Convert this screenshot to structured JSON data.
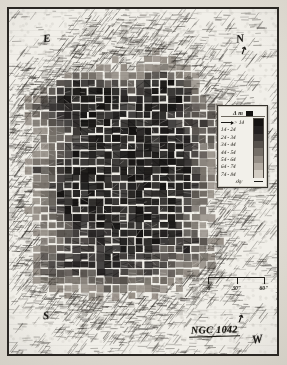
{
  "figure": {
    "object_name": "NGC 1042",
    "plot_type": "hand-drawn surface photometry / isophote cell map",
    "background_note": "scanned printed plate with dark rectangular frame"
  },
  "compass": {
    "east": "E",
    "north": "N",
    "south": "S",
    "west": "W",
    "north_tick": "↗",
    "west_tick": "↗"
  },
  "legend": {
    "header_symbol": "Δ m",
    "header_swatch_color": "#141211",
    "rows": [
      {
        "label": "> 14",
        "swatch": "#141211"
      },
      {
        "label": "14 - 24",
        "swatch": "#232020"
      },
      {
        "label": "24 - 34",
        "swatch": "#3a3634"
      },
      {
        "label": "34 - 44",
        "swatch": "#56514c"
      },
      {
        "label": "44 - 54",
        "swatch": "#746e67"
      },
      {
        "label": "54 - 64",
        "swatch": "#938c84"
      },
      {
        "label": "64 - 74",
        "swatch": "#b3aca3"
      },
      {
        "label": "74 - 84",
        "swatch": "#d2ccc3"
      },
      {
        "label": "sky",
        "swatch": "line"
      }
    ]
  },
  "scalebar": {
    "ticks": [
      "0",
      "30\"",
      "60\""
    ],
    "segments": 2
  },
  "chart_data": {
    "type": "heatmap",
    "title": "NGC 1042",
    "xlabel": "",
    "ylabel": "",
    "grid": true,
    "legend_position": "right",
    "value_name": "Δ m (magnitude bin)",
    "bins": [
      "> 14",
      "14 - 24",
      "24 - 34",
      "34 - 44",
      "44 - 54",
      "54 - 64",
      "64 - 74",
      "74 - 84",
      "sky"
    ],
    "bin_colors": [
      "#141211",
      "#232020",
      "#3a3634",
      "#56514c",
      "#746e67",
      "#938c84",
      "#b3aca3",
      "#d2ccc3",
      "#f0eee8"
    ],
    "grid_cols": 34,
    "grid_rows": 44,
    "core_center_col": 14,
    "core_center_row": 21,
    "core_radius_cols": 9,
    "core_radius_rows": 11,
    "halo_radius_cols": 17,
    "halo_radius_rows": 21,
    "scale_ticks": [
      "0",
      "30\"",
      "60\""
    ]
  }
}
